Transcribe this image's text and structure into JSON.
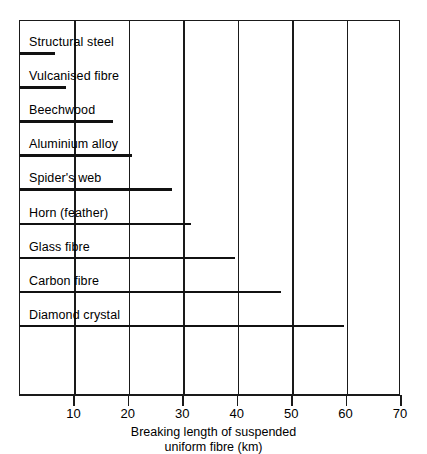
{
  "chart_data": {
    "type": "bar",
    "orientation": "horizontal",
    "title": "",
    "subtitle": "",
    "xlabel": "Breaking length of suspended uniform fibre (km)",
    "xlabel_lines": [
      "Breaking length of suspended",
      "uniform fibre (km)"
    ],
    "ylabel": "",
    "xlim": [
      0,
      70
    ],
    "ylim": [
      0,
      9
    ],
    "grid": true,
    "grid_axis": "x",
    "legend": false,
    "legend_position": "none",
    "axis_tick_values": [
      10,
      20,
      30,
      40,
      50,
      60,
      70
    ],
    "axis_tick_labels": [
      "10",
      "20",
      "30",
      "40",
      "50",
      "60",
      "70"
    ],
    "categories": [
      "Structural steel",
      "Vulcanised fibre",
      "Beechwood",
      "Aluminium alloy",
      "Spider's web",
      "Horn (feather)",
      "Glass fibre",
      "Carbon fibre",
      "Diamond crystal"
    ],
    "values": [
      6.5,
      8.5,
      17,
      20.5,
      28,
      31.5,
      39.5,
      48,
      59.5
    ],
    "units": "km",
    "series": [
      {
        "name": "Breaking length",
        "values": [
          6.5,
          8.5,
          17,
          20.5,
          28,
          31.5,
          39.5,
          48,
          59.5
        ]
      }
    ],
    "bar_color": "#111111",
    "frame_color": "#1a1a1a",
    "background_color": "#ffffff"
  },
  "axis": {
    "title_line_1": "Breaking length of suspended",
    "title_line_2": "uniform fibre (km)"
  },
  "bars": [
    {
      "label": "Structural steel",
      "value": 6.5
    },
    {
      "label": "Vulcanised fibre",
      "value": 8.5
    },
    {
      "label": "Beechwood",
      "value": 17
    },
    {
      "label": "Aluminium alloy",
      "value": 20.5
    },
    {
      "label": "Spider's web",
      "value": 28
    },
    {
      "label": "Horn (feather)",
      "value": 31.5
    },
    {
      "label": "Glass fibre",
      "value": 39.5
    },
    {
      "label": "Carbon fibre",
      "value": 48
    },
    {
      "label": "Diamond crystal",
      "value": 59.5
    }
  ]
}
